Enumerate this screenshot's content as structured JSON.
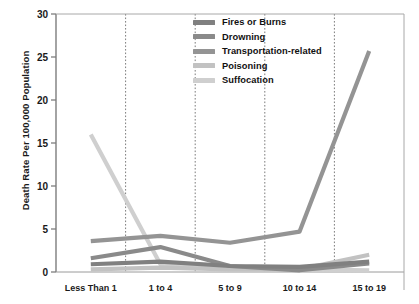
{
  "chart_data": {
    "type": "line",
    "title": "",
    "xlabel": "",
    "ylabel": "Death Rate Per 100,000 Population",
    "categories": [
      "Less Than 1",
      "1 to 4",
      "5 to 9",
      "10 to 14",
      "15 to 19"
    ],
    "ylim": [
      0,
      30
    ],
    "yticks": [
      0,
      5,
      10,
      15,
      20,
      25,
      30
    ],
    "ytick_labels": [
      "0",
      "5",
      "10",
      "15",
      "20",
      "25",
      "30"
    ],
    "grid": "vertical-dotted",
    "legend_position": "top-center",
    "series": [
      {
        "name": "Fires or Burns",
        "color": "#808080",
        "values": [
          0.9,
          1.2,
          0.7,
          0.6,
          1.2
        ]
      },
      {
        "name": "Drowning",
        "color": "#8a8a8a",
        "values": [
          1.6,
          2.9,
          0.7,
          0.2,
          1.0
        ]
      },
      {
        "name": "Transportation-related",
        "color": "#949494",
        "values": [
          3.6,
          4.2,
          3.4,
          4.7,
          25.7
        ]
      },
      {
        "name": "Poisoning",
        "color": "#c2c2c2",
        "values": [
          0.3,
          0.5,
          0.3,
          0.3,
          2.0
        ]
      },
      {
        "name": "Suffocation",
        "color": "#cfcfcf",
        "values": [
          16.0,
          0.9,
          0.4,
          0.3,
          0.2
        ]
      }
    ]
  },
  "axis": {
    "y_title": "Death Rate Per 100,000 Population"
  },
  "legend": {
    "items": [
      {
        "label": "Fires or Burns"
      },
      {
        "label": "Drowning"
      },
      {
        "label": "Transportation-related"
      },
      {
        "label": "Poisoning"
      },
      {
        "label": "Suffocation"
      }
    ]
  }
}
